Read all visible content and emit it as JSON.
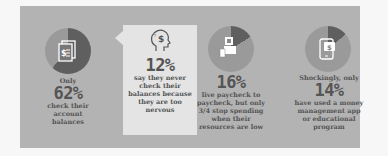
{
  "stats": [
    {
      "id": "check-balances",
      "icon": "document-dollar-icon",
      "prefix": "Only",
      "percent": "62%",
      "lines": [
        "check their",
        "account",
        "balances"
      ]
    },
    {
      "id": "never-check",
      "icon": "head-dollar-icon",
      "prefix": "",
      "percent": "12%",
      "lines": [
        "say they never",
        "check their",
        "balances because",
        "they are too",
        "nervous"
      ]
    },
    {
      "id": "paycheck-to-paycheck",
      "icon": "cash-hand-icon",
      "prefix": "",
      "percent": "16%",
      "lines": [
        "live paycheck to",
        "paycheck, but only",
        "3/4 stop spending",
        "when their",
        "resources are low"
      ]
    },
    {
      "id": "money-app",
      "icon": "phone-dollar-icon",
      "prefix": "Shockingly, only",
      "percent": "14%",
      "lines": [
        "have used a money",
        "management app",
        "or educational",
        "program"
      ]
    }
  ],
  "colors": {
    "panel": "#b3b3b3",
    "callout": "#e4e4e4",
    "circle": "#9a9a9a",
    "slice": "#5f5f5f",
    "text": "#4a4a4a"
  }
}
